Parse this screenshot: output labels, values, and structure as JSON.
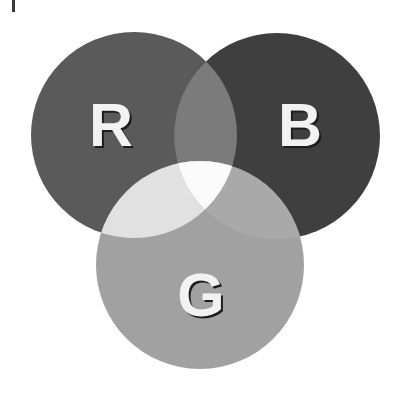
{
  "diagram": {
    "type": "venn",
    "sets": [
      {
        "id": "R",
        "label": "R",
        "color": "#5a5a5a"
      },
      {
        "id": "B",
        "label": "B",
        "color": "#3f3f3f"
      },
      {
        "id": "G",
        "label": "G",
        "color": "#a1a1a1"
      }
    ],
    "overlaps": {
      "R_B": "#7b7b7b",
      "R_G": "#e1e1e1",
      "B_G": "#a9a9a9",
      "R_B_G": "#fbfbfb"
    },
    "label_color": "#f2f2f2",
    "label_shadow_color": "#1c1c1c"
  },
  "labels": {
    "r": "R",
    "b": "B",
    "g": "G"
  }
}
